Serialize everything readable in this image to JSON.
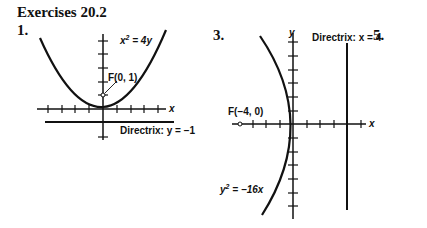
{
  "heading": "Exercises 20.2",
  "exercises": [
    {
      "number": "1.",
      "equation": "x² = 4y",
      "equation_parts": {
        "lhs_var": "x",
        "exp": "2",
        "rhs": " = 4y"
      },
      "focus_label": "F(0, 1)",
      "directrix_label": "Directrix: y = −1",
      "axis_x_label": "x"
    },
    {
      "number": "3.",
      "equation": "y² = −16x",
      "equation_parts": {
        "lhs_var": "y",
        "exp": "2",
        "rhs": " = −16x"
      },
      "focus_label": "F(−4, 0)",
      "directrix_label": "Directrix: x = 4",
      "axis_x_label": "x",
      "axis_y_label": "y"
    },
    {
      "number": "5."
    }
  ]
}
